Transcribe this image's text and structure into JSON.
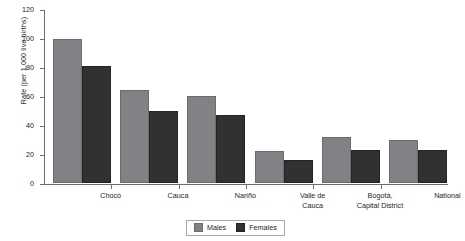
{
  "chart_data": {
    "type": "bar",
    "title": "",
    "xlabel": "",
    "ylabel": "Rate (per 1,000 live births)",
    "ylim": [
      0,
      120
    ],
    "yticks": [
      0,
      20,
      40,
      60,
      80,
      100,
      120
    ],
    "grid": false,
    "legend_position": "bottom",
    "categories": [
      "Chocó",
      "Cauca",
      "Nariño",
      "Valle de\nCauca",
      "Bogotá,\nCapital District",
      "National"
    ],
    "category_lines": [
      [
        "Chocó"
      ],
      [
        "Cauca"
      ],
      [
        "Nariño"
      ],
      [
        "Valle de",
        "Cauca"
      ],
      [
        "Bogotá,",
        "Capital District"
      ],
      [
        "National"
      ]
    ],
    "series": [
      {
        "name": "Males",
        "color": "#808285",
        "values": [
          99,
          64,
          60,
          22,
          32,
          30
        ]
      },
      {
        "name": "Females",
        "color": "#313131",
        "values": [
          81,
          50,
          47,
          16,
          23,
          23
        ]
      }
    ]
  },
  "legend": {
    "items": [
      {
        "label": "Males",
        "color": "#808285"
      },
      {
        "label": "Females",
        "color": "#313131"
      }
    ]
  }
}
